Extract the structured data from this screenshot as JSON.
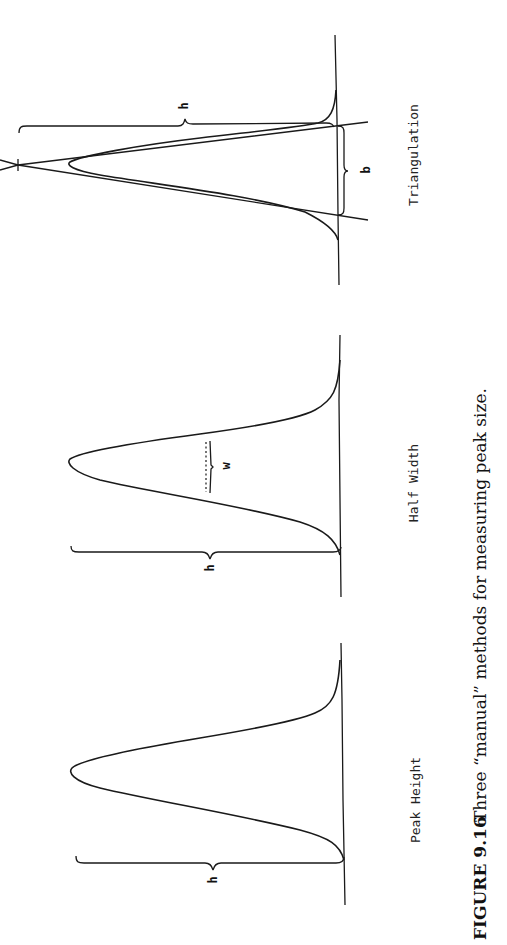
{
  "figure": {
    "number_label": "FIGURE 9.16",
    "caption": "Three “manual” methods for measuring peak size.",
    "orientation": "rotated 90 degrees counter-clockwise"
  },
  "panels": [
    {
      "id": "peak-height",
      "label": "Peak Height",
      "annotations": [
        {
          "symbol": "h",
          "meaning": "peak height from baseline to apex"
        }
      ]
    },
    {
      "id": "half-width",
      "label": "Half Width",
      "annotations": [
        {
          "symbol": "h",
          "meaning": "peak height"
        },
        {
          "symbol": "w",
          "meaning": "width at half height"
        }
      ]
    },
    {
      "id": "triangulation",
      "label": "Triangulation",
      "annotations": [
        {
          "symbol": "h",
          "meaning": "height of triangle formed by tangents"
        },
        {
          "symbol": "b",
          "meaning": "base width between tangent intercepts"
        }
      ]
    }
  ]
}
